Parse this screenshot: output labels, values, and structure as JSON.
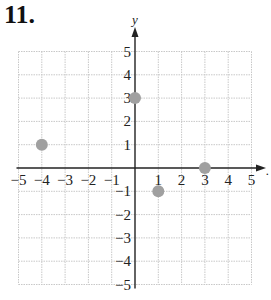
{
  "problem_number": "11.",
  "chart_data": {
    "type": "scatter",
    "title": "",
    "xlabel": "x",
    "ylabel": "y",
    "xlim": [
      -5,
      5
    ],
    "ylim": [
      -5,
      5
    ],
    "grid": true,
    "x_ticks": [
      -5,
      -4,
      -3,
      -2,
      -1,
      1,
      2,
      3,
      4,
      5
    ],
    "y_ticks": [
      -5,
      -4,
      -3,
      -2,
      -1,
      1,
      2,
      3,
      4,
      5
    ],
    "points": [
      {
        "x": -4,
        "y": 1
      },
      {
        "x": 0,
        "y": 3
      },
      {
        "x": 1,
        "y": -1
      },
      {
        "x": 3,
        "y": 0
      }
    ],
    "point_color": "#a0a0a0",
    "grid_color": "#c8c8c8",
    "axis_color": "#222222"
  }
}
